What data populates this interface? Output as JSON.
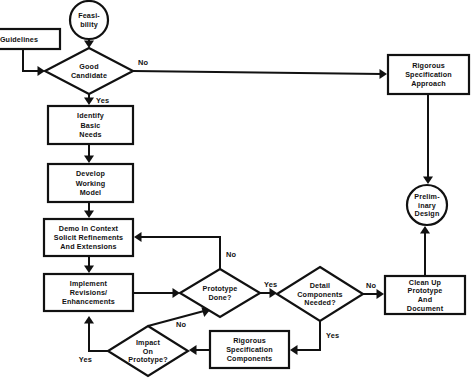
{
  "diagram": {
    "colors": {
      "background": "#ffffff",
      "stroke": "#111111",
      "fill": "#ffffff"
    },
    "nodes": [
      {
        "id": "feasibility",
        "name": "terminator-feasibility",
        "shape": "circle",
        "lines": [
          "Feasi-",
          "bility"
        ],
        "cx": 89,
        "cy": 20,
        "r": 19
      },
      {
        "id": "guidelines",
        "name": "process-guidelines",
        "shape": "rect",
        "lines": [
          "Guidelines"
        ],
        "x": -22,
        "y": 29,
        "w": 82,
        "h": 20
      },
      {
        "id": "good-candidate",
        "name": "decision-good-candidate",
        "shape": "diamond",
        "lines": [
          "Good",
          "Candidate"
        ],
        "cx": 89,
        "cy": 71,
        "rx": 44,
        "ry": 23
      },
      {
        "id": "identify-basic-needs",
        "name": "process-identify-basic-needs",
        "shape": "rect",
        "lines": [
          "Identify",
          "Basic",
          "Needs"
        ],
        "x": 48,
        "y": 106,
        "w": 85,
        "h": 38
      },
      {
        "id": "develop-working-model",
        "name": "process-develop-working-model",
        "shape": "rect",
        "lines": [
          "Develop",
          "Working",
          "Model"
        ],
        "x": 48,
        "y": 164,
        "w": 85,
        "h": 38
      },
      {
        "id": "demo-in-context",
        "name": "process-demo-in-context",
        "shape": "rect",
        "lines": [
          "Demo In Context",
          "Solicit Refinements",
          "And Extensions"
        ],
        "x": 44,
        "y": 219,
        "w": 89,
        "h": 37
      },
      {
        "id": "implement-revisions",
        "name": "process-implement-revisions",
        "shape": "rect",
        "lines": [
          "Implement",
          "Revisions/",
          "Enhancements"
        ],
        "x": 44,
        "y": 274,
        "w": 89,
        "h": 37
      },
      {
        "id": "prototype-done",
        "name": "decision-prototype-done",
        "shape": "diamond",
        "lines": [
          "Prototype",
          "Done?"
        ],
        "cx": 220,
        "cy": 293,
        "rx": 40,
        "ry": 24
      },
      {
        "id": "detail-components-needed",
        "name": "decision-detail-components-needed",
        "shape": "diamond",
        "lines": [
          "Detail",
          "Components",
          "Needed?"
        ],
        "cx": 320,
        "cy": 294,
        "rx": 43,
        "ry": 27
      },
      {
        "id": "impact-on-prototype",
        "name": "decision-impact-on-prototype",
        "shape": "diamond",
        "lines": [
          "Impact",
          "On",
          "Prototype?"
        ],
        "cx": 148,
        "cy": 351,
        "rx": 40,
        "ry": 25
      },
      {
        "id": "rigorous-spec-components",
        "name": "process-rigorous-specification-components",
        "shape": "rect",
        "lines": [
          "Rigorous",
          "Specification",
          "Components"
        ],
        "x": 210,
        "y": 331,
        "w": 79,
        "h": 37
      },
      {
        "id": "clean-up-prototype",
        "name": "process-clean-up-prototype",
        "shape": "rect",
        "lines": [
          "Clean Up",
          "Prototype",
          "And",
          "Document"
        ],
        "x": 385,
        "y": 276,
        "w": 80,
        "h": 38
      },
      {
        "id": "rigorous-spec-approach",
        "name": "process-rigorous-specification-approach",
        "shape": "rect",
        "lines": [
          "Rigorous",
          "Specification",
          "Approach"
        ],
        "x": 388,
        "y": 55,
        "w": 81,
        "h": 39
      },
      {
        "id": "preliminary-design",
        "name": "terminator-preliminary-design",
        "shape": "circle",
        "lines": [
          "Prelim-",
          "inary",
          "Design"
        ],
        "cx": 427,
        "cy": 205,
        "r": 20
      }
    ],
    "edges": [
      {
        "id": "e-feasibility-to-good-candidate",
        "name": "edge-feasibility-to-good-candidate",
        "from": "feasibility",
        "to": "good-candidate",
        "path": "M 89 39 L 89 44",
        "arrow": {
          "x": 89,
          "y": 48,
          "dir": "down"
        },
        "label": null
      },
      {
        "id": "e-guidelines-to-good-candidate",
        "name": "edge-guidelines-to-good-candidate",
        "from": "guidelines",
        "to": "good-candidate",
        "path": "M 23 49 L 23 71 L 39 71",
        "arrow": {
          "x": 45,
          "y": 71,
          "dir": "right"
        },
        "label": null
      },
      {
        "id": "e-good-candidate-no",
        "name": "edge-good-candidate-no-to-rigorous-approach",
        "from": "good-candidate",
        "to": "rigorous-spec-approach",
        "path": "M 133 71 L 382 74",
        "arrow": {
          "x": 387,
          "y": 74,
          "dir": "right"
        },
        "label": {
          "text": "No",
          "x": 138,
          "y": 65,
          "anchor": "start"
        }
      },
      {
        "id": "e-good-candidate-yes",
        "name": "edge-good-candidate-yes-to-identify-needs",
        "from": "good-candidate",
        "to": "identify-basic-needs",
        "path": "M 89 94 L 89 100",
        "arrow": {
          "x": 89,
          "y": 105,
          "dir": "down"
        },
        "label": {
          "text": "Yes",
          "x": 96,
          "y": 103,
          "anchor": "start"
        }
      },
      {
        "id": "e-identify-to-develop",
        "name": "edge-identify-needs-to-develop-model",
        "from": "identify-basic-needs",
        "to": "develop-working-model",
        "path": "M 89 144 L 89 158",
        "arrow": {
          "x": 89,
          "y": 163,
          "dir": "down"
        },
        "label": null
      },
      {
        "id": "e-develop-to-demo",
        "name": "edge-develop-model-to-demo-in-context",
        "from": "develop-working-model",
        "to": "demo-in-context",
        "path": "M 89 202 L 89 213",
        "arrow": {
          "x": 89,
          "y": 218,
          "dir": "down"
        },
        "label": null
      },
      {
        "id": "e-demo-to-implement",
        "name": "edge-demo-to-implement-revisions",
        "from": "demo-in-context",
        "to": "implement-revisions",
        "path": "M 89 256 L 89 268",
        "arrow": {
          "x": 89,
          "y": 273,
          "dir": "down"
        },
        "label": null
      },
      {
        "id": "e-implement-to-prototype-done",
        "name": "edge-implement-revisions-to-prototype-done",
        "from": "implement-revisions",
        "to": "prototype-done",
        "path": "M 133 293 L 174 293",
        "arrow": {
          "x": 180,
          "y": 293,
          "dir": "right"
        },
        "label": null
      },
      {
        "id": "e-prototype-done-no",
        "name": "edge-prototype-done-no-to-demo",
        "from": "prototype-done",
        "to": "demo-in-context",
        "path": "M 220 269 L 220 237 L 139 237",
        "arrow": {
          "x": 134,
          "y": 237,
          "dir": "left"
        },
        "label": {
          "text": "No",
          "x": 226,
          "y": 257,
          "anchor": "start"
        }
      },
      {
        "id": "e-prototype-done-yes",
        "name": "edge-prototype-done-yes-to-detail-components",
        "from": "prototype-done",
        "to": "detail-components-needed",
        "path": "M 260 293 L 271 293",
        "arrow": {
          "x": 277,
          "y": 293,
          "dir": "right"
        },
        "label": {
          "text": "Yes",
          "x": 264,
          "y": 287,
          "anchor": "start"
        }
      },
      {
        "id": "e-detail-components-no",
        "name": "edge-detail-components-no-to-clean-up",
        "from": "detail-components-needed",
        "to": "clean-up-prototype",
        "path": "M 363 294 L 379 294",
        "arrow": {
          "x": 384,
          "y": 294,
          "dir": "right"
        },
        "label": {
          "text": "No",
          "x": 366,
          "y": 288,
          "anchor": "start"
        }
      },
      {
        "id": "e-detail-components-yes",
        "name": "edge-detail-components-yes-to-rigorous-components",
        "from": "detail-components-needed",
        "to": "rigorous-spec-components",
        "path": "M 320 321 L 320 350 L 296 350",
        "arrow": {
          "x": 290,
          "y": 350,
          "dir": "left"
        },
        "label": {
          "text": "Yes",
          "x": 326,
          "y": 338,
          "anchor": "start"
        }
      },
      {
        "id": "e-rigorous-components-to-impact",
        "name": "edge-rigorous-components-to-impact-on-prototype",
        "from": "rigorous-spec-components",
        "to": "impact-on-prototype",
        "path": "M 210 350 L 195 350",
        "arrow": {
          "x": 189,
          "y": 350,
          "dir": "left"
        },
        "label": null
      },
      {
        "id": "e-impact-no",
        "name": "edge-impact-no-to-prototype-done",
        "from": "impact-on-prototype",
        "to": "prototype-done",
        "path": "M 148 326 L 204 311",
        "arrow": {
          "x": 210,
          "y": 310,
          "dir": "upright"
        },
        "label": {
          "text": "No",
          "x": 176,
          "y": 327,
          "anchor": "start"
        }
      },
      {
        "id": "e-impact-yes",
        "name": "edge-impact-yes-to-implement-revisions",
        "from": "impact-on-prototype",
        "to": "implement-revisions",
        "path": "M 108 351 L 89 351 L 89 322",
        "arrow": {
          "x": 89,
          "y": 316,
          "dir": "up"
        },
        "label": {
          "text": "Yes",
          "x": 92,
          "y": 362,
          "anchor": "end"
        }
      },
      {
        "id": "e-rigorous-approach-to-preliminary",
        "name": "edge-rigorous-approach-to-preliminary-design",
        "from": "rigorous-spec-approach",
        "to": "preliminary-design",
        "path": "M 428 94 L 428 179",
        "arrow": {
          "x": 428,
          "y": 184,
          "dir": "down"
        },
        "label": null
      },
      {
        "id": "e-clean-up-to-preliminary",
        "name": "edge-clean-up-to-preliminary-design",
        "from": "clean-up-prototype",
        "to": "preliminary-design",
        "path": "M 425 276 L 425 232",
        "arrow": {
          "x": 425,
          "y": 226,
          "dir": "up"
        },
        "label": null
      }
    ]
  }
}
